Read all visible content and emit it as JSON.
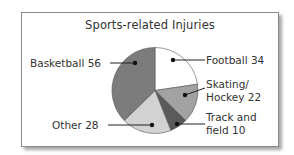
{
  "chart_data": {
    "type": "pie",
    "title": "Sports-related Injuries",
    "categories": [
      "Football",
      "Skating/Hockey",
      "Track and field",
      "Other",
      "Basketball"
    ],
    "values": [
      34,
      22,
      10,
      28,
      56
    ],
    "colors": [
      "#ffffff",
      "#a2a2a2",
      "#5a5a5a",
      "#d2d2d2",
      "#7c7c7c"
    ],
    "start_angle": "12 o'clock",
    "direction": "clockwise",
    "legend": "none (callout labels)"
  },
  "labels": {
    "football": "Football  34",
    "skating_line1": "Skating/",
    "skating_line2": "Hockey  22",
    "track_line1": "Track and",
    "track_line2": "field  10",
    "other": "Other  28",
    "basketball": "Basketball  56"
  }
}
